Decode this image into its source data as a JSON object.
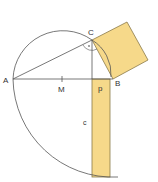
{
  "diagram": {
    "labels": {
      "A": "A",
      "B": "B",
      "C": "C",
      "M": "M",
      "p": "p",
      "c": "c",
      "right_angle_dot": "·"
    },
    "colors": {
      "fill": "#f6d98a",
      "stroke": "#555555",
      "fill_stroke": "#8a7a4a"
    }
  }
}
